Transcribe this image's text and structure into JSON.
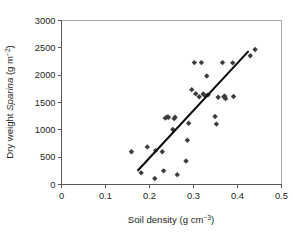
{
  "chart_data": {
    "type": "scatter",
    "title": "",
    "xlabel": "Soil density (g cm-3)",
    "ylabel": "Dry weight Sparina (g m-2)",
    "xlabel_parts": {
      "prefix": "Soil density (g cm",
      "exponent": "−3",
      "suffix": ")"
    },
    "ylabel_parts": {
      "prefix": "Dry weight ",
      "italic": "Sparina",
      "middle": " (g m",
      "exponent": "−2",
      "suffix": ")"
    },
    "xlim": [
      0,
      0.5
    ],
    "ylim": [
      0,
      3000
    ],
    "xticks": [
      0,
      0.1,
      0.2,
      0.3,
      0.4,
      0.5
    ],
    "xticklabels": [
      "0",
      "0.1",
      "0.2",
      "0.3",
      "0.4",
      "0.5"
    ],
    "yticks": [
      0,
      500,
      1000,
      1500,
      2000,
      2500,
      3000
    ],
    "yticklabels": [
      "0",
      "500",
      "1000",
      "1500",
      "2000",
      "2500",
      "3000"
    ],
    "grid": false,
    "legend": null,
    "marker": "diamond",
    "marker_color": "#3a3d40",
    "x": [
      0.159,
      0.181,
      0.195,
      0.212,
      0.214,
      0.229,
      0.232,
      0.236,
      0.24,
      0.243,
      0.253,
      0.256,
      0.258,
      0.263,
      0.283,
      0.286,
      0.289,
      0.296,
      0.302,
      0.305,
      0.313,
      0.318,
      0.322,
      0.325,
      0.33,
      0.333,
      0.349,
      0.352,
      0.356,
      0.366,
      0.369,
      0.371,
      0.373,
      0.389,
      0.391,
      0.429,
      0.44
    ],
    "y": [
      600,
      213,
      688,
      110,
      620,
      600,
      250,
      1215,
      1235,
      1230,
      1005,
      1205,
      1230,
      180,
      430,
      810,
      1120,
      1735,
      2230,
      1660,
      1605,
      2230,
      1655,
      1635,
      1985,
      1640,
      1245,
      1105,
      1595,
      2230,
      1605,
      1615,
      1570,
      2225,
      1610,
      2355,
      2470
    ],
    "series_name": "Spartina dry weight vs soil density",
    "fit_line": {
      "type": "linear",
      "x_start": 0.174,
      "y_start": 260,
      "x_end": 0.424,
      "y_end": 2430,
      "color": "#0b0d0e"
    }
  },
  "figure": {
    "background": "#ffffff",
    "axis_color": "#555a5d",
    "frame_color": "#a8acae",
    "text_color": "#1d1f21"
  }
}
